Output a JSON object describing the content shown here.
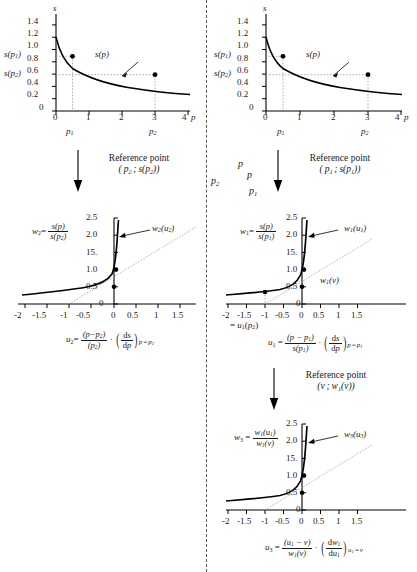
{
  "figure": {
    "title_present": false,
    "divider": "vertical-dash-dot-line"
  },
  "panels": {
    "top_left": {
      "name": "supply-curve-p2-reference",
      "y_axis_label": "s",
      "x_axis_label": "p",
      "y_ticks": [
        "1.4",
        "1.2",
        "1.0",
        "0.8",
        "0.6",
        "0.4",
        "0.2",
        "0"
      ],
      "x_ticks": [
        "0",
        "1",
        "2",
        "3",
        "4"
      ],
      "curve_label": "s(p)",
      "y_special_labels": [
        "s(p1)",
        "s(p2)"
      ],
      "x_special_labels": [
        "p1",
        "p2"
      ],
      "points": [
        {
          "x": 0.5,
          "y": 0.89
        },
        {
          "x": 3.0,
          "y": 0.59
        }
      ]
    },
    "top_right": {
      "name": "supply-curve-p1-reference",
      "y_axis_label": "s",
      "x_axis_label": "p",
      "y_ticks": [
        "1.4",
        "1.2",
        "1.0",
        "0.8",
        "0.6",
        "0.4",
        "0.2",
        "0"
      ],
      "x_ticks": [
        "0",
        "1",
        "2",
        "3",
        "4"
      ],
      "curve_label": "s(p)",
      "y_special_labels": [
        "s(p1)",
        "s(p2)"
      ],
      "x_special_labels": [
        "p1",
        "p2"
      ],
      "points": [
        {
          "x": 0.5,
          "y": 0.89
        },
        {
          "x": 3.0,
          "y": 0.59
        }
      ]
    },
    "mid_left": {
      "name": "w2-normalized-curve",
      "y_axis_expr_num": "s(p)",
      "y_axis_expr_den": "s(p2)",
      "y_axis_var": "w2",
      "y_ticks": [
        "2.5",
        "2.0",
        "15.",
        "1.0",
        "0.5",
        "0"
      ],
      "x_ticks": [
        "-2",
        "-1.5",
        "-1",
        "-0.5",
        "0",
        "0.5",
        "1",
        "1.5"
      ],
      "curve_label": "w2(u2)"
    },
    "mid_right": {
      "name": "w1-normalized-curve",
      "y_axis_expr_num": "s(p)",
      "y_axis_expr_den": "s(p1)",
      "y_axis_var": "w1",
      "y_ticks": [
        "2.5",
        "2.0",
        "15.",
        "1.0",
        "0.5",
        "0"
      ],
      "x_ticks": [
        "-2",
        "-1.5",
        "-1",
        "-0.5",
        "0",
        "0.5",
        "1",
        "1.5"
      ],
      "curve_label": "w1(u1)",
      "secondary_label": "w1(v)",
      "axis_note": "= u1(p2)"
    },
    "bottom_right": {
      "name": "w3-normalized-curve",
      "y_axis_expr_num": "w1(u1)",
      "y_axis_expr_den": "w1(v)",
      "y_axis_var": "w3",
      "y_ticks": [
        "2.5",
        "2.0",
        "15.",
        "1.0",
        "0.5",
        "0"
      ],
      "x_ticks": [
        "-2",
        "-1.5",
        "-1",
        "-0.5",
        "0",
        "0.5",
        "1",
        "1.5"
      ],
      "curve_label": "w3(u3)"
    }
  },
  "annotations": {
    "ref_left": {
      "line1": "Reference point",
      "line2": "( p2 ; s(p2) )"
    },
    "ref_right": {
      "line1": "Reference point",
      "line2": "( p1 ; s(p1) )"
    },
    "ref_bottom": {
      "line1": "Reference point",
      "line2": "( v ; w1(v) )"
    },
    "stray_labels": [
      "p",
      "p",
      "p2",
      "p1"
    ]
  },
  "formulas": {
    "u2": {
      "lhs": "u2",
      "num": "(p - p2)",
      "den": "(p2)",
      "deriv_num": "ds",
      "deriv_den": "dp",
      "subscript": "p = p2"
    },
    "u1": {
      "lhs": "u1",
      "num": "(p - p1)",
      "den": "s(p1)",
      "deriv_num": "ds",
      "deriv_den": "dp",
      "subscript": "p = p1"
    },
    "u3": {
      "lhs": "u3",
      "num": "(u1 - v)",
      "den": "w1(v)",
      "deriv_num": "dw1",
      "deriv_den": "du1",
      "subscript": "u1 = v"
    }
  },
  "colors": {
    "curve": "#000000",
    "axis": "#000000",
    "guide": "#9a9a9a",
    "divider": "#444444",
    "background": "#ffffff"
  }
}
